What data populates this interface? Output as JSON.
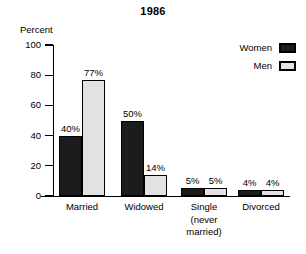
{
  "chart_data": {
    "type": "bar",
    "title": "1986",
    "xlabel": "",
    "ylabel": "Percent",
    "ylim": [
      0,
      100
    ],
    "yticks": [
      0,
      20,
      40,
      60,
      80,
      100
    ],
    "ytick_labels": [
      "0",
      "20",
      "40",
      "60",
      "80",
      "100"
    ],
    "grid": false,
    "legend_position": "top-right",
    "categories": [
      "Married",
      "Widowed",
      "Single\n(never\nmarried)",
      "Divorced"
    ],
    "category_labels": [
      "Married",
      "Widowed",
      "Single (never married)",
      "Divorced"
    ],
    "series": [
      {
        "name": "Women",
        "color": "#1c1c1c",
        "values": [
          40,
          50,
          5,
          4
        ],
        "value_labels": [
          "40%",
          "50%",
          "5%",
          "4%"
        ]
      },
      {
        "name": "Men",
        "color": "#e2e2e2",
        "values": [
          77,
          14,
          5,
          4
        ],
        "value_labels": [
          "77%",
          "14%",
          "5%",
          "4%"
        ]
      }
    ]
  },
  "legend": {
    "items": [
      {
        "label": "Women",
        "swatch": "women"
      },
      {
        "label": "Men",
        "swatch": "men"
      }
    ]
  },
  "axis": {
    "y_title": "Percent"
  }
}
